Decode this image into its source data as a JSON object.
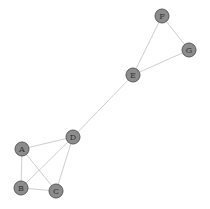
{
  "graph": {
    "nodes": [
      {
        "id": "A",
        "label": "A"
      },
      {
        "id": "B",
        "label": "B"
      },
      {
        "id": "C",
        "label": "C"
      },
      {
        "id": "D",
        "label": "D"
      },
      {
        "id": "E",
        "label": "E"
      },
      {
        "id": "F",
        "label": "F"
      },
      {
        "id": "G",
        "label": "G"
      }
    ],
    "edges": [
      [
        "A",
        "B"
      ],
      [
        "A",
        "C"
      ],
      [
        "A",
        "D"
      ],
      [
        "B",
        "C"
      ],
      [
        "B",
        "D"
      ],
      [
        "C",
        "D"
      ],
      [
        "D",
        "E"
      ],
      [
        "E",
        "F"
      ],
      [
        "E",
        "G"
      ],
      [
        "F",
        "G"
      ]
    ],
    "colors": {
      "node_fill": "#8c8c8c",
      "node_stroke": "#5a5a5a",
      "edge": "#cfcfcf",
      "label": "#333333"
    }
  }
}
